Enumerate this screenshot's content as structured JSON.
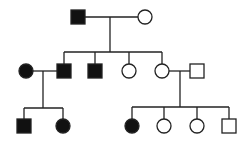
{
  "diagram": {
    "type": "pedigree",
    "colors": {
      "affected": "#111111",
      "unaffected": "#ffffff",
      "line": "#222222"
    },
    "generations": [
      {
        "label": "I",
        "individuals": [
          {
            "id": "I-1",
            "sex": "male",
            "affected": true,
            "cx": 78,
            "cy": 17
          },
          {
            "id": "I-2",
            "sex": "female",
            "affected": false,
            "cx": 145,
            "cy": 17
          }
        ]
      },
      {
        "label": "II",
        "individuals": [
          {
            "id": "II-spouse-1",
            "sex": "female",
            "affected": true,
            "cx": 26,
            "cy": 71
          },
          {
            "id": "II-1",
            "sex": "male",
            "affected": true,
            "cx": 64,
            "cy": 71
          },
          {
            "id": "II-2",
            "sex": "male",
            "affected": true,
            "cx": 95,
            "cy": 71
          },
          {
            "id": "II-3",
            "sex": "female",
            "affected": false,
            "cx": 129,
            "cy": 71
          },
          {
            "id": "II-4",
            "sex": "female",
            "affected": false,
            "cx": 162,
            "cy": 71
          },
          {
            "id": "II-spouse-2",
            "sex": "male",
            "affected": false,
            "cx": 197,
            "cy": 71
          }
        ]
      },
      {
        "label": "III",
        "individuals": [
          {
            "id": "III-1",
            "sex": "male",
            "affected": true,
            "cx": 24,
            "cy": 126
          },
          {
            "id": "III-2",
            "sex": "female",
            "affected": true,
            "cx": 63,
            "cy": 126
          },
          {
            "id": "III-3",
            "sex": "female",
            "affected": true,
            "cx": 132,
            "cy": 126
          },
          {
            "id": "III-4",
            "sex": "female",
            "affected": false,
            "cx": 164,
            "cy": 126
          },
          {
            "id": "III-5",
            "sex": "female",
            "affected": false,
            "cx": 197,
            "cy": 126
          },
          {
            "id": "III-6",
            "sex": "male",
            "affected": false,
            "cx": 229,
            "cy": 126
          }
        ]
      }
    ],
    "lines": [
      {
        "name": "mating-line-I",
        "x1": 85,
        "y1": 17,
        "x2": 138,
        "y2": 17
      },
      {
        "name": "descent-line-I",
        "x1": 110,
        "y1": 17,
        "x2": 110,
        "y2": 52
      },
      {
        "name": "sibship-line-II",
        "x1": 64,
        "y1": 52,
        "x2": 162,
        "y2": 52
      },
      {
        "name": "drop-II-1",
        "x1": 64,
        "y1": 52,
        "x2": 64,
        "y2": 64
      },
      {
        "name": "drop-II-2",
        "x1": 95,
        "y1": 52,
        "x2": 95,
        "y2": 64
      },
      {
        "name": "drop-II-3",
        "x1": 129,
        "y1": 52,
        "x2": 129,
        "y2": 64
      },
      {
        "name": "drop-II-4",
        "x1": 162,
        "y1": 52,
        "x2": 162,
        "y2": 64
      },
      {
        "name": "mating-line-II-left",
        "x1": 33,
        "y1": 71,
        "x2": 57,
        "y2": 71
      },
      {
        "name": "descent-line-II-left",
        "x1": 43,
        "y1": 71,
        "x2": 43,
        "y2": 108
      },
      {
        "name": "sibship-line-III-left",
        "x1": 24,
        "y1": 108,
        "x2": 63,
        "y2": 108
      },
      {
        "name": "drop-III-1",
        "x1": 24,
        "y1": 108,
        "x2": 24,
        "y2": 119
      },
      {
        "name": "drop-III-2",
        "x1": 63,
        "y1": 108,
        "x2": 63,
        "y2": 119
      },
      {
        "name": "mating-line-II-right",
        "x1": 169,
        "y1": 71,
        "x2": 190,
        "y2": 71
      },
      {
        "name": "descent-line-II-right",
        "x1": 180,
        "y1": 71,
        "x2": 180,
        "y2": 107
      },
      {
        "name": "sibship-line-III-right",
        "x1": 132,
        "y1": 107,
        "x2": 229,
        "y2": 107
      },
      {
        "name": "drop-III-3",
        "x1": 132,
        "y1": 107,
        "x2": 132,
        "y2": 119
      },
      {
        "name": "drop-III-4",
        "x1": 164,
        "y1": 107,
        "x2": 164,
        "y2": 119
      },
      {
        "name": "drop-III-5",
        "x1": 197,
        "y1": 107,
        "x2": 197,
        "y2": 119
      },
      {
        "name": "drop-III-6",
        "x1": 229,
        "y1": 107,
        "x2": 229,
        "y2": 119
      }
    ],
    "symbol_size": 14
  }
}
